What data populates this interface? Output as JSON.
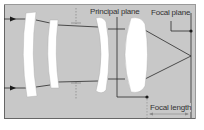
{
  "diagram": {
    "labels": {
      "principal_plane": "Principal plane",
      "focal_plane": "Focal plane",
      "focal_length": "Focal length"
    },
    "colors": {
      "background": "#c8c8c8",
      "lens": "#ffffff",
      "line": "#2a2a2a",
      "frame": "#555555"
    },
    "elements": {
      "lenses": 4,
      "incoming_rays": 2,
      "arrow_icons": 2
    }
  }
}
